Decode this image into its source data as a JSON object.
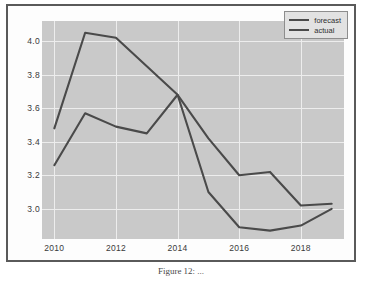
{
  "figure": {
    "caption": "Figure 12: ...",
    "background_color": "#fdfdfd",
    "border_color": "#5a5a5a"
  },
  "legend": {
    "position": "top-right",
    "entries": [
      {
        "label": "forecast",
        "color": "#4a4a4a"
      },
      {
        "label": "actual",
        "color": "#4a4a4a"
      }
    ]
  },
  "axes": {
    "y_ticks": [
      "4.0",
      "3.8",
      "3.6",
      "3.4",
      "3.2",
      "3.0"
    ],
    "x_ticks": [
      "2010",
      "2012",
      "2014",
      "2016",
      "2018"
    ],
    "plot_background": "#c9c9c9",
    "grid_color": "#ededed"
  },
  "chart_data": {
    "type": "line",
    "title": "",
    "xlabel": "",
    "ylabel": "",
    "x": [
      2010,
      2011,
      2012,
      2013,
      2014,
      2015,
      2016,
      2017,
      2018,
      2019
    ],
    "xlim": [
      2009.6,
      2019.4
    ],
    "ylim": [
      2.82,
      4.12
    ],
    "grid": true,
    "legend_position": "upper right",
    "series": [
      {
        "name": "forecast",
        "color": "#4a4a4a",
        "values": [
          3.48,
          4.05,
          4.02,
          3.85,
          3.68,
          3.1,
          2.89,
          2.87,
          2.9,
          3.0
        ]
      },
      {
        "name": "actual",
        "color": "#4a4a4a",
        "values": [
          3.26,
          3.57,
          3.49,
          3.45,
          3.68,
          3.42,
          3.2,
          3.22,
          3.02,
          3.03
        ]
      }
    ]
  }
}
